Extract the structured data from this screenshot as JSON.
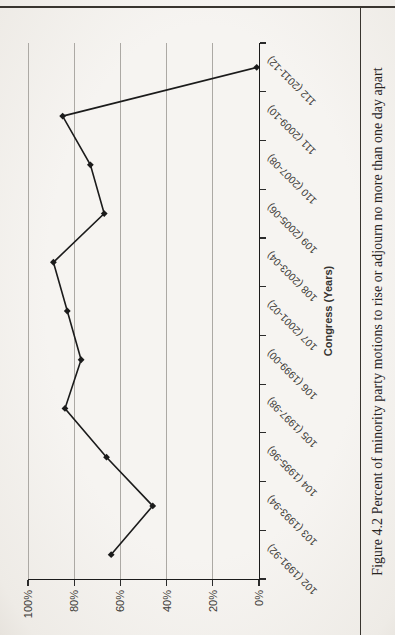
{
  "figure": {
    "caption": "Figure 4.2 Percent of minority party motions to rise or adjourn no more than one day apart"
  },
  "chart_data": {
    "type": "line",
    "title": "",
    "xlabel": "Congress (Years)",
    "ylabel": "",
    "categories": [
      "102 (1991-92)",
      "103 (1993-94)",
      "104 (1995-96)",
      "105 (1997-98)",
      "106 (1999-00)",
      "107 (2001-02)",
      "108 (2003-04)",
      "109 (2005-06)",
      "110 (2007-08)",
      "111 (2009-10)",
      "112 (2011-12)"
    ],
    "values": [
      64,
      46,
      66,
      84,
      77,
      83,
      89,
      67,
      73,
      85,
      1
    ],
    "ylim": [
      0,
      100
    ],
    "yticks": [
      100,
      80,
      60,
      40,
      20,
      0
    ],
    "ytick_labels": [
      "100%",
      "80%",
      "60%",
      "40%",
      "20%",
      "0%"
    ],
    "grid": true,
    "legend": "none",
    "marker": "diamond",
    "series_color": "#1b1b1b",
    "grid_color": "#aca9a4",
    "orientation": "rotated-90ccw"
  }
}
